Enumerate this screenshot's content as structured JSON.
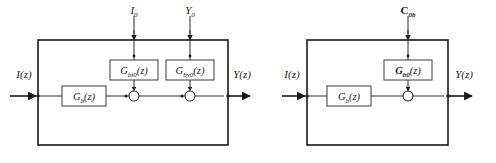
{
  "figure": {
    "caption": "",
    "background_color": "#ffffff",
    "line_color": "#1a1a1a",
    "box_fill": "#ffffff"
  },
  "diagrams": [
    {
      "id": "diagram-left",
      "outer_block_label": "",
      "input_label": "I(z)",
      "output_label": "Y(z)",
      "forward_block": "Gb(z)",
      "forward_block_base": "G",
      "forward_block_sub": "b",
      "forward_block_tail": "(z)",
      "top_inputs": [
        {
          "label_base": "I",
          "label_sub": "0",
          "name": "I0"
        },
        {
          "label_base": "Y",
          "label_sub": "0",
          "name": "Y0"
        }
      ],
      "injection_blocks": [
        {
          "base": "G",
          "sub": "bi0",
          "tail": "(z)",
          "full": "Gbi0(z)"
        },
        {
          "base": "G",
          "sub": "by0",
          "tail": "(z)",
          "full": "Gby0(z)"
        }
      ],
      "summing_junctions": 2
    },
    {
      "id": "diagram-right",
      "outer_block_label": "",
      "input_label": "I(z)",
      "output_label": "Y(z)",
      "forward_block": "Gb(z)",
      "forward_block_base": "G",
      "forward_block_sub": "b",
      "forward_block_tail": "(z)",
      "top_inputs": [
        {
          "label_base": "C",
          "label_sub": "0b",
          "name": "C0b"
        }
      ],
      "injection_blocks": [
        {
          "base": "G",
          "sub": "b0",
          "tail": "(z)",
          "full": "Gb0(z)"
        }
      ],
      "summing_junctions": 1
    }
  ],
  "text": {
    "d1_input": "I(z)",
    "d1_output": "Y(z)",
    "d1_fwd_base": "G",
    "d1_fwd_sub": "b",
    "d1_fwd_tail": "(z)",
    "d1_top1_base": "I",
    "d1_top1_sub": "0",
    "d1_top2_base": "Y",
    "d1_top2_sub": "0",
    "d1_blk1_base": "G",
    "d1_blk1_sub": "bi0",
    "d1_blk1_tail": "(z)",
    "d1_blk2_base": "G",
    "d1_blk2_sub": "by0",
    "d1_blk2_tail": "(z)",
    "d2_input": "I(z)",
    "d2_output": "Y(z)",
    "d2_fwd_base": "G",
    "d2_fwd_sub": "b",
    "d2_fwd_tail": "(z)",
    "d2_top1_base": "C",
    "d2_top1_sub": "0b",
    "d2_blk1_base": "G",
    "d2_blk1_sub": "b0",
    "d2_blk1_tail": "(z)"
  }
}
